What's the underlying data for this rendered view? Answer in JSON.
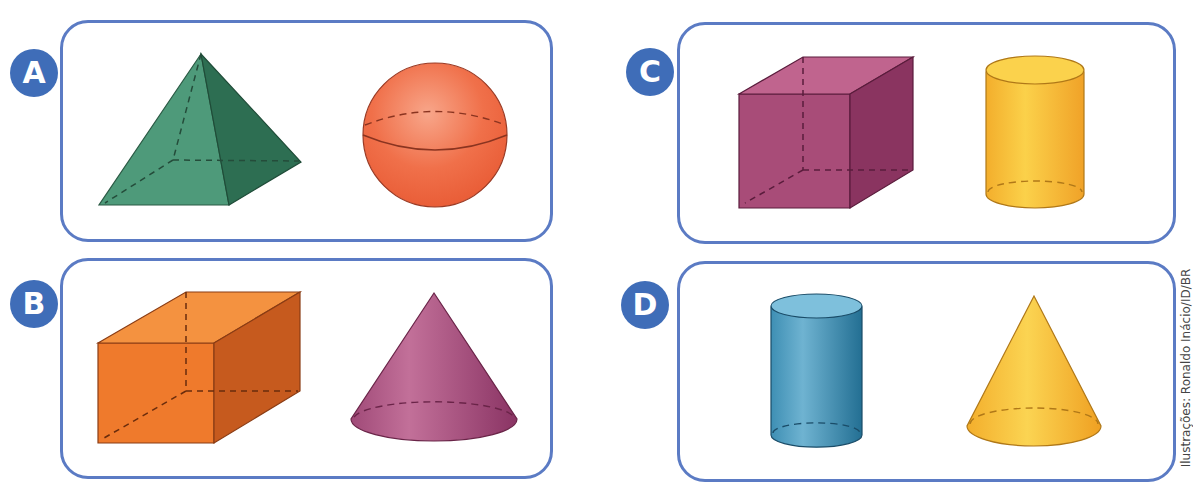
{
  "panels": [
    {
      "label": "A",
      "shapes": [
        "square pyramid",
        "sphere"
      ]
    },
    {
      "label": "B",
      "shapes": [
        "rectangular prism",
        "cone"
      ]
    },
    {
      "label": "C",
      "shapes": [
        "cube",
        "cylinder"
      ]
    },
    {
      "label": "D",
      "shapes": [
        "cylinder",
        "cone"
      ]
    }
  ],
  "credit": "Ilustrações: Ronaldo Inácio/ID/BR",
  "colors": {
    "panel_border": "#5b7bc4",
    "badge": "#3f6db8",
    "pyramid_light": "#4e9a7a",
    "pyramid_dark": "#2d6e52",
    "sphere": "#f0704a",
    "prism_front": "#ef7a2c",
    "prism_top": "#f49240",
    "prism_side": "#c65a1e",
    "cone_pink": "#b05a86",
    "cube_front": "#a84c78",
    "cube_top": "#c0648e",
    "cube_side": "#8a3460",
    "cylinder_yellow": "#f6b834",
    "cylinder_blue": "#3c8cb0",
    "cone_yellow": "#f6b834"
  }
}
